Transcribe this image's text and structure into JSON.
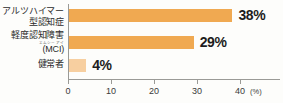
{
  "chart_data": {
    "type": "bar",
    "orientation": "horizontal",
    "title": "",
    "xlabel": "(%)",
    "ylabel": "",
    "xlim": [
      0,
      43
    ],
    "xticks": [
      0,
      10,
      20,
      30,
      40
    ],
    "xtick_labels": [
      "0",
      "10",
      "20",
      "30",
      "40"
    ],
    "unit": "(%)",
    "grid": false,
    "legend": null,
    "categories": [
      "アルツハイマー型認知症",
      "軽度認知障害（MCI）",
      "健常者"
    ],
    "category_lines": [
      [
        "アルツハイマー",
        "型認知症"
      ],
      [
        "軽度認知障害",
        "(MCI)"
      ],
      [
        "健常者"
      ]
    ],
    "ruby": "エムシーアイ",
    "values": [
      38,
      29,
      4
    ],
    "value_labels": [
      "38%",
      "29%",
      "4%"
    ],
    "bar_colors": [
      "#f0a951",
      "#f0a951",
      "#f7cfa0"
    ]
  },
  "colors": {
    "bar_primary": "#f0a951",
    "bar_light": "#f7cfa0",
    "axis": "#9a9a96",
    "text": "#2b2b2b",
    "background": "#fdfdfb"
  }
}
